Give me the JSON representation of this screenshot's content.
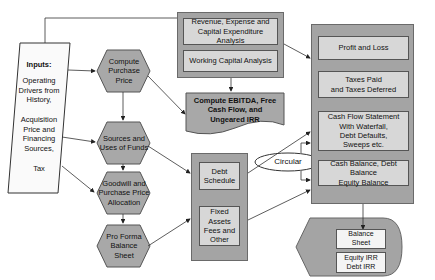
{
  "diagram": {
    "inputs": {
      "heading": "Inputs:",
      "lines": "Operating\nDrivers from\nHistory,\n\nAcquisition\nPrice and\nFinancing\nSources,\n\nTax"
    },
    "hexagons": [
      {
        "id": "compute-purchase-price",
        "label": "Compute\nPurchase\nPrice"
      },
      {
        "id": "sources-uses",
        "label": "Sources and\nUses of Funds"
      },
      {
        "id": "goodwill",
        "label": "Goodwill and\nPurchase Price\nAllocation"
      },
      {
        "id": "pro-forma",
        "label": "Pro Forma\nBalance\nSheet"
      }
    ],
    "analysis_group": {
      "items": [
        {
          "label": "Revenue, Expense and\nCapital Expenditure Analysis"
        },
        {
          "label": "Working Capital Analysis"
        }
      ]
    },
    "ebitda_document": {
      "label": "Compute EBITDA, Free\nCash Flow, and\nUngeared IRR"
    },
    "schedule_group": {
      "items": [
        {
          "label": "Debt\nSchedule"
        },
        {
          "label": "Fixed\nAssets\nFees and\nOther"
        }
      ]
    },
    "statements_group": {
      "items": [
        {
          "label": "Profit and Loss"
        },
        {
          "label": "Taxes Paid\nand Taxes Deferred"
        },
        {
          "label": "Cash Flow Statement\nWith Waterfall,\nDebt Defaults,\nSweeps etc."
        },
        {
          "label": "Cash Balance, Debt Balance\nEquity Balance"
        }
      ]
    },
    "circular_label": "Circular",
    "output_display": {
      "items": [
        {
          "label": "Balance\nSheet"
        },
        {
          "label": "Equity IRR\nDebt IRR"
        }
      ]
    },
    "colors": {
      "outer_gray": "#a4a4a4",
      "inner_light": "#d7d7d7",
      "inner_white": "#f4f4f4",
      "line": "#333333"
    }
  }
}
